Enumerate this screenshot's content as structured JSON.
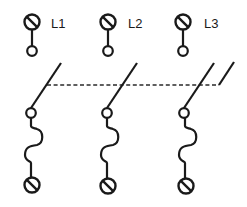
{
  "diagram": {
    "type": "electrical schematic",
    "colors": {
      "stroke": "#1a1a1a",
      "background": "#ffffff"
    },
    "poles": [
      {
        "id": "pole-1",
        "label": "L1",
        "x": 32,
        "top_screw": {
          "cx": 32,
          "cy": 22,
          "r": 7.5
        },
        "upper_contact": {
          "cx": 32,
          "cy": 51,
          "r": 4.8
        },
        "lower_contact": {
          "cx": 31,
          "cy": 113,
          "r": 4.8
        },
        "blade": {
          "x1": 31,
          "y1": 108,
          "x2": 61,
          "y2": 63
        },
        "fuse_path": "M31 118 L31 126 C31 128 34 128 37 129 C44 131 44 143 37 145 C30 146 25 147 25 155 C25 161 31 161 31 163 L31 177",
        "bottom_screw": {
          "cx": 32,
          "cy": 185,
          "r": 7.5
        },
        "label_x": 51,
        "label_y": 28
      },
      {
        "id": "pole-2",
        "label": "L2",
        "x": 108,
        "top_screw": {
          "cx": 108,
          "cy": 22,
          "r": 7.5
        },
        "upper_contact": {
          "cx": 108,
          "cy": 51,
          "r": 4.8
        },
        "lower_contact": {
          "cx": 107,
          "cy": 113,
          "r": 4.8
        },
        "blade": {
          "x1": 107,
          "y1": 108,
          "x2": 137,
          "y2": 63
        },
        "fuse_path": "M107 118 L107 126 C107 128 110 128 113 129 C120 131 120 143 113 145 C106 146 101 147 101 155 C101 161 107 161 107 163 L107 178",
        "bottom_screw": {
          "cx": 108,
          "cy": 186,
          "r": 7.5
        },
        "label_x": 128,
        "label_y": 28
      },
      {
        "id": "pole-3",
        "label": "L3",
        "x": 184,
        "top_screw": {
          "cx": 183,
          "cy": 22,
          "r": 7.5
        },
        "upper_contact": {
          "cx": 183,
          "cy": 51,
          "r": 4.8
        },
        "lower_contact": {
          "cx": 184,
          "cy": 113,
          "r": 4.8
        },
        "blade": {
          "x1": 184,
          "y1": 108,
          "x2": 214,
          "y2": 63
        },
        "fuse_path": "M185 118 L185 126 C185 128 188 128 191 129 C198 131 198 143 191 145 C184 146 179 147 179 155 C179 161 185 161 185 163 L185 178",
        "bottom_screw": {
          "cx": 186,
          "cy": 186,
          "r": 7.5
        },
        "label_x": 204,
        "label_y": 28
      }
    ],
    "mechanical_linkage": {
      "style": "dashed",
      "y": 85,
      "x_start": 47,
      "x_end": 219,
      "end_stroke": {
        "x1": 219,
        "y1": 85,
        "x2": 234,
        "y2": 62
      }
    }
  }
}
